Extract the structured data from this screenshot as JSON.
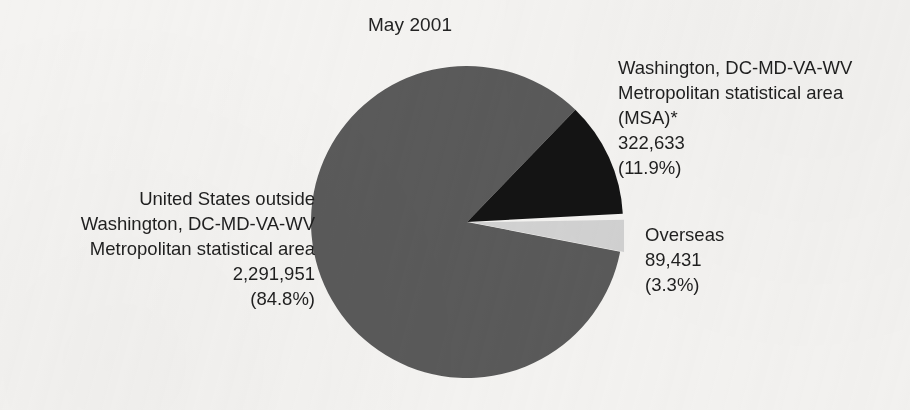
{
  "chart_data": {
    "type": "pie",
    "title": "May 2001",
    "total": 2704015,
    "legend_position": "callout-labels",
    "grid": false,
    "categories": [
      "United States outside Washington, DC-MD-VA-WV Metropolitan statistical area",
      "Washington, DC-MD-VA-WV Metropolitan statistical area (MSA)*",
      "Overseas"
    ],
    "values": [
      2291951,
      322633,
      89431
    ],
    "percentages": [
      84.8,
      11.9,
      3.3
    ],
    "colors": [
      "#5a5a5a",
      "#141414",
      "#d2d2d2"
    ],
    "slices": [
      {
        "key": "us-outside",
        "name": "United States outside Washington, DC-MD-VA-WV Metropolitan statistical area",
        "value": 2291951,
        "value_label": "2,291,951",
        "percent": 84.8,
        "percent_label": "(84.8%)",
        "color": "#5a5a5a",
        "start_angle": 11,
        "end_angle": 314,
        "exploded": false
      },
      {
        "key": "msa",
        "name": "Washington, DC-MD-VA-WV Metropolitan statistical area (MSA)*",
        "value": 322633,
        "value_label": "322,633",
        "percent": 11.9,
        "percent_label": "(11.9%)",
        "color": "#141414",
        "start_angle": 314,
        "end_angle": 357,
        "exploded": false
      },
      {
        "key": "overseas",
        "name": "Overseas",
        "value": 89431,
        "value_label": "89,431",
        "percent": 3.3,
        "percent_label": "(3.3%)",
        "color": "#d2d2d2",
        "start_angle": 359,
        "end_angle": 371,
        "exploded": true
      }
    ]
  },
  "labels": {
    "us_outside": {
      "line1": "United States outside",
      "line2": "Washington, DC-MD-VA-WV",
      "line3": "Metropolitan statistical area",
      "line4": "2,291,951",
      "line5": "(84.8%)"
    },
    "msa": {
      "line1": "Washington, DC-MD-VA-WV",
      "line2": "Metropolitan statistical area",
      "line3": "(MSA)*",
      "line4": "322,633",
      "line5": "(11.9%)"
    },
    "overseas": {
      "line1": "Overseas",
      "line2": "89,431",
      "line3": "(3.3%)"
    }
  }
}
